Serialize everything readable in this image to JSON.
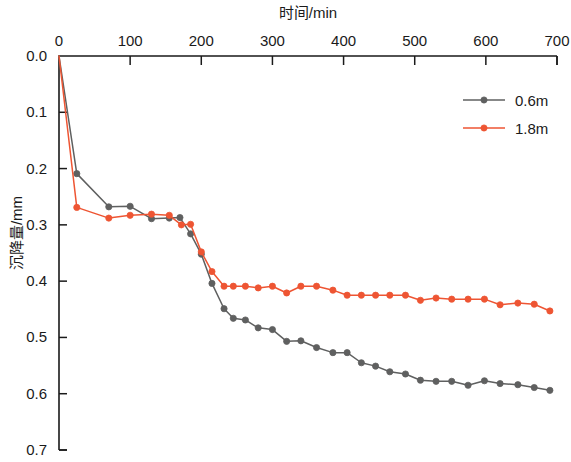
{
  "chart_data": {
    "type": "line",
    "title": "",
    "xlabel": "时间/min",
    "ylabel": "沉降量/mm",
    "xlim": [
      0,
      700
    ],
    "ylim": [
      0.0,
      0.7
    ],
    "y_axis_inverted": true,
    "grid": false,
    "legend_position": "top-right",
    "xticks": [
      0,
      100,
      200,
      300,
      400,
      500,
      600,
      700
    ],
    "xtick_labels": [
      "0",
      "100",
      "200",
      "300",
      "400",
      "500",
      "600",
      "700"
    ],
    "yticks": [
      0.0,
      0.1,
      0.2,
      0.3,
      0.4,
      0.5,
      0.6,
      0.7
    ],
    "ytick_labels": [
      "0.0",
      "0.1",
      "0.2",
      "0.3",
      "0.4",
      "0.5",
      "0.6",
      "0.7"
    ],
    "series": [
      {
        "name": "0.6m",
        "color": "#5f6060",
        "marker": "circle",
        "x": [
          0,
          25,
          70,
          100,
          130,
          155,
          170,
          185,
          200,
          215,
          232,
          245,
          262,
          280,
          300,
          320,
          340,
          362,
          385,
          405,
          425,
          445,
          465,
          487,
          508,
          530,
          552,
          575,
          598,
          620,
          645,
          668,
          690
        ],
        "y": [
          0.0,
          0.209,
          0.268,
          0.267,
          0.289,
          0.288,
          0.287,
          0.316,
          0.352,
          0.404,
          0.449,
          0.466,
          0.469,
          0.483,
          0.486,
          0.507,
          0.506,
          0.518,
          0.527,
          0.527,
          0.545,
          0.551,
          0.561,
          0.565,
          0.576,
          0.578,
          0.578,
          0.585,
          0.577,
          0.582,
          0.584,
          0.589,
          0.594
        ]
      },
      {
        "name": "1.8m",
        "color": "#ee5533",
        "marker": "circle",
        "x": [
          0,
          25,
          70,
          100,
          130,
          155,
          172,
          185,
          200,
          215,
          232,
          245,
          262,
          280,
          300,
          320,
          340,
          362,
          385,
          405,
          425,
          445,
          465,
          487,
          508,
          530,
          552,
          575,
          598,
          620,
          645,
          668,
          690
        ],
        "y": [
          0.0,
          0.269,
          0.288,
          0.283,
          0.281,
          0.283,
          0.3,
          0.299,
          0.348,
          0.383,
          0.409,
          0.409,
          0.409,
          0.412,
          0.409,
          0.421,
          0.409,
          0.409,
          0.416,
          0.425,
          0.425,
          0.425,
          0.425,
          0.425,
          0.434,
          0.43,
          0.432,
          0.432,
          0.432,
          0.442,
          0.439,
          0.441,
          0.453
        ]
      }
    ]
  },
  "legend": {
    "entries": [
      {
        "label": "0.6m",
        "color": "#5f6060"
      },
      {
        "label": "1.8m",
        "color": "#ee5533"
      }
    ]
  },
  "axes": {
    "x_title": "时间/min",
    "y_title": "沉降量/mm"
  }
}
